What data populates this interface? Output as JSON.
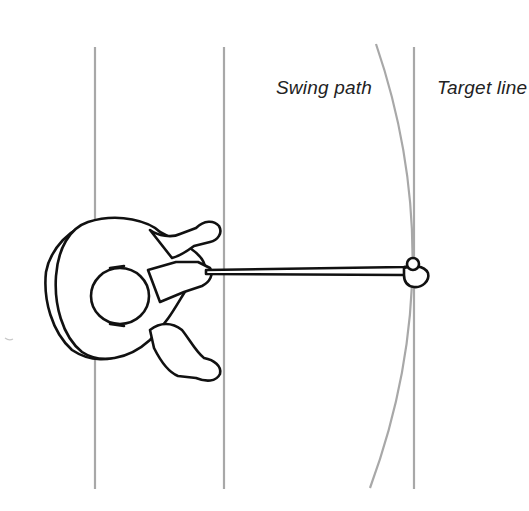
{
  "diagram": {
    "type": "golf swing top-down illustration",
    "labels": {
      "swing_path": "Swing path",
      "target_line": "Target line"
    },
    "elements": {
      "vertical_guides": [
        "left-foot-line",
        "right-foot-line",
        "target-line"
      ],
      "curve": "swing-path-arc",
      "figure": "golfer-top-view",
      "club": "club-shaft-and-head",
      "ball": "golf-ball"
    },
    "colors": {
      "guide_lines": "#9a9a9a",
      "ink": "#111111",
      "background": "#ffffff"
    }
  }
}
